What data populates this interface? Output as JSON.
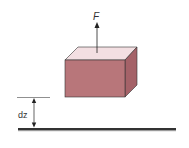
{
  "diagram": {
    "force_label": "F",
    "distance_label": "dz",
    "colors": {
      "box_front": "#b8767a",
      "box_top": "#f3dfe2",
      "box_side": "#a56268",
      "outline": "#333333",
      "ground": "#333333",
      "ground_shadow": "#9a9a9a"
    }
  }
}
